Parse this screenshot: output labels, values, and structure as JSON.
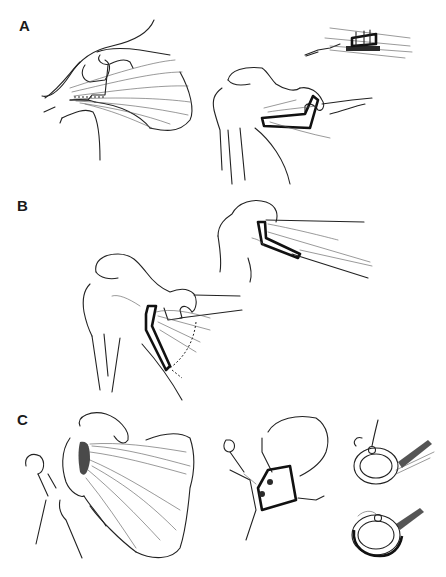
{
  "figure": {
    "panels": [
      {
        "label": "A",
        "description": "Shoulder anatomy with muscle transfer; detail of tendon fixation"
      },
      {
        "label": "B",
        "description": "Shoulder anatomy with tendon transfer to humerus; detail view"
      },
      {
        "label": "C",
        "description": "Scapular muscle view, bone window with fixation holes, and two cross-section details"
      }
    ],
    "caption": {
      "text": "",
      "visible": "cut-off, illegible"
    },
    "colors": {
      "ink": "#222222",
      "background": "#ffffff"
    }
  }
}
